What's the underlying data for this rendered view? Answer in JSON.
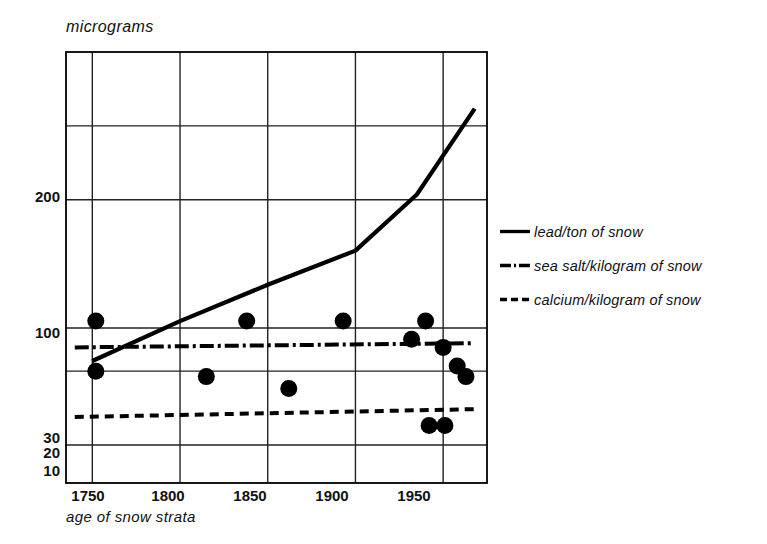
{
  "chart_data": {
    "type": "line",
    "title": "",
    "ylabel": "micrograms",
    "xlabel": "age of snow strata",
    "y_scale": "log",
    "ylim": [
      7,
      400
    ],
    "xlim": [
      1735,
      1975
    ],
    "grid": true,
    "y_ticks": [
      {
        "value": 200,
        "label": "200"
      },
      {
        "value": 100,
        "label": "100"
      },
      {
        "value": 30,
        "label": "30"
      },
      {
        "value": 20,
        "label": "20"
      },
      {
        "value": 10,
        "label": "10"
      }
    ],
    "x_ticks": [
      {
        "value": 1750,
        "label": "1750"
      },
      {
        "value": 1800,
        "label": "1800"
      },
      {
        "value": 1850,
        "label": "1850"
      },
      {
        "value": 1900,
        "label": "1900"
      },
      {
        "value": 1950,
        "label": "1950"
      }
    ],
    "legend_position": "right",
    "series": [
      {
        "name": "lead/ton of snow",
        "style": "solid",
        "x": [
          1750,
          1800,
          1850,
          1900,
          1935,
          1968
        ],
        "values": [
          22,
          32,
          45,
          62,
          105,
          235
        ]
      },
      {
        "name": "sea salt/kilogram of snow",
        "style": "dash-dot",
        "x": [
          1740,
          1968
        ],
        "values": [
          25,
          26
        ]
      },
      {
        "name": "calcium/kilogram of snow",
        "style": "dashed",
        "x": [
          1740,
          1968
        ],
        "values": [
          13,
          14
        ]
      }
    ],
    "scatter_points": {
      "name": "measured samples",
      "marker": "filled-circle",
      "points": [
        {
          "x": 1752,
          "y": 32
        },
        {
          "x": 1752,
          "y": 20
        },
        {
          "x": 1815,
          "y": 19
        },
        {
          "x": 1838,
          "y": 32
        },
        {
          "x": 1862,
          "y": 17
        },
        {
          "x": 1893,
          "y": 32
        },
        {
          "x": 1932,
          "y": 27
        },
        {
          "x": 1940,
          "y": 32
        },
        {
          "x": 1942,
          "y": 12
        },
        {
          "x": 1950,
          "y": 25
        },
        {
          "x": 1951,
          "y": 12
        },
        {
          "x": 1958,
          "y": 21
        },
        {
          "x": 1963,
          "y": 19
        }
      ]
    },
    "colors": {
      "line": "#000000",
      "grid": "#222222",
      "axis": "#000000",
      "background": "#ffffff"
    }
  }
}
